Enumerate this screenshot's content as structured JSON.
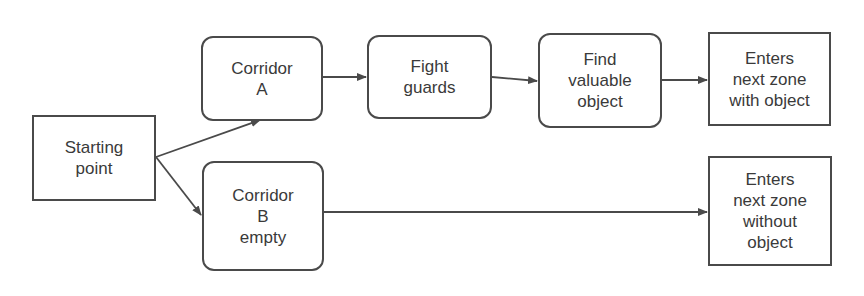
{
  "diagram": {
    "type": "flowchart",
    "nodes": [
      {
        "id": "start",
        "label": "Starting\npoint",
        "shape": "rect"
      },
      {
        "id": "corridor_a",
        "label": "Corridor\nA",
        "shape": "rounded"
      },
      {
        "id": "fight",
        "label": "Fight\nguards",
        "shape": "rounded"
      },
      {
        "id": "find",
        "label": "Find\nvaluable\nobject",
        "shape": "rounded"
      },
      {
        "id": "exit_with",
        "label": "Enters\nnext zone\nwith object",
        "shape": "rect"
      },
      {
        "id": "corridor_b",
        "label": "Corridor\nB\nempty",
        "shape": "rounded"
      },
      {
        "id": "exit_without",
        "label": "Enters\nnext zone\nwithout\nobject",
        "shape": "rect"
      }
    ],
    "edges": [
      {
        "from": "start",
        "to": "corridor_a"
      },
      {
        "from": "start",
        "to": "corridor_b"
      },
      {
        "from": "corridor_a",
        "to": "fight"
      },
      {
        "from": "fight",
        "to": "find"
      },
      {
        "from": "find",
        "to": "exit_with"
      },
      {
        "from": "corridor_b",
        "to": "exit_without"
      }
    ],
    "colors": {
      "stroke": "#4a4a4a",
      "text": "#3a3a3a",
      "background": "#ffffff"
    }
  }
}
